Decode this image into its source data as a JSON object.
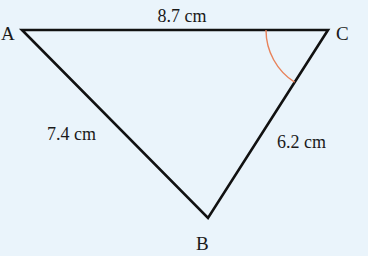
{
  "diagram": {
    "type": "triangle",
    "background_color": "#eaf4fb",
    "line_color": "#111111",
    "angle_marker_color": "#e8825a",
    "vertices": [
      {
        "id": "A",
        "label": "A",
        "x": 22,
        "y": 30
      },
      {
        "id": "B",
        "label": "B",
        "x": 208,
        "y": 218
      },
      {
        "id": "C",
        "label": "C",
        "x": 328,
        "y": 30
      }
    ],
    "sides": [
      {
        "id": "AC",
        "from": "A",
        "to": "C",
        "label": "8.7 cm"
      },
      {
        "id": "AB",
        "from": "A",
        "to": "B",
        "label": "7.4 cm"
      },
      {
        "id": "BC",
        "from": "B",
        "to": "C",
        "label": "6.2 cm"
      }
    ],
    "marked_angle": {
      "vertex": "C",
      "between": [
        "CA",
        "CB"
      ]
    }
  }
}
